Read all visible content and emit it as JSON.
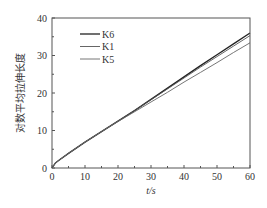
{
  "chart_data": {
    "type": "line",
    "title": "",
    "xlabel": "t/s",
    "ylabel": "对数平均拉伸长度",
    "xlim": [
      0,
      60
    ],
    "ylim": [
      0,
      40
    ],
    "xticks": [
      0,
      10,
      20,
      30,
      40,
      50,
      60
    ],
    "yticks": [
      0,
      10,
      20,
      30,
      40
    ],
    "grid": false,
    "legend_position": "upper-left",
    "x": [
      0,
      1,
      2,
      5,
      10,
      15,
      20,
      25,
      30,
      35,
      40,
      45,
      50,
      55,
      60
    ],
    "series": [
      {
        "name": "K6",
        "color": "#222222",
        "values": [
          0,
          1.3,
          2.0,
          3.9,
          6.9,
          9.7,
          12.5,
          15.3,
          18.3,
          21.3,
          24.3,
          27.3,
          30.2,
          33.1,
          36.0
        ]
      },
      {
        "name": "K1",
        "color": "#555555",
        "values": [
          0,
          1.3,
          2.0,
          3.9,
          6.9,
          9.7,
          12.5,
          15.3,
          18.2,
          21.1,
          24.0,
          26.9,
          29.7,
          32.5,
          35.3
        ]
      },
      {
        "name": "K5",
        "color": "#666666",
        "values": [
          0,
          1.3,
          2.0,
          3.9,
          6.9,
          9.7,
          12.4,
          15.0,
          17.6,
          20.2,
          22.9,
          25.5,
          28.1,
          30.8,
          33.4
        ]
      }
    ]
  }
}
